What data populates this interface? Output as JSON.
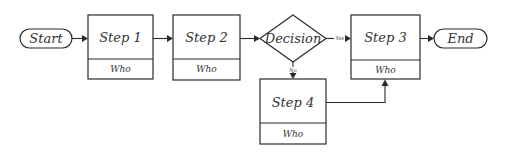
{
  "diagram": {
    "type": "flowchart",
    "nodes": {
      "start": {
        "label": "Start",
        "shape": "terminator"
      },
      "step1": {
        "label": "Step 1",
        "sublabel": "Who",
        "shape": "process"
      },
      "step2": {
        "label": "Step 2",
        "sublabel": "Who",
        "shape": "process"
      },
      "decision": {
        "label": "Decision",
        "shape": "decision"
      },
      "step3": {
        "label": "Step 3",
        "sublabel": "Who",
        "shape": "process"
      },
      "step4": {
        "label": "Step 4",
        "sublabel": "Who",
        "shape": "process"
      },
      "end": {
        "label": "End",
        "shape": "terminator"
      }
    },
    "edges": {
      "yes_label": "Yes",
      "no_label": "No",
      "list": [
        {
          "from": "start",
          "to": "step1"
        },
        {
          "from": "step1",
          "to": "step2"
        },
        {
          "from": "step2",
          "to": "decision"
        },
        {
          "from": "decision",
          "to": "step3",
          "label": "Yes"
        },
        {
          "from": "decision",
          "to": "step4",
          "label": "No"
        },
        {
          "from": "step4",
          "to": "step3"
        },
        {
          "from": "step3",
          "to": "end"
        }
      ]
    },
    "colors": {
      "stroke": "#2a2a2a",
      "text": "#333333",
      "background": "#ffffff"
    }
  }
}
